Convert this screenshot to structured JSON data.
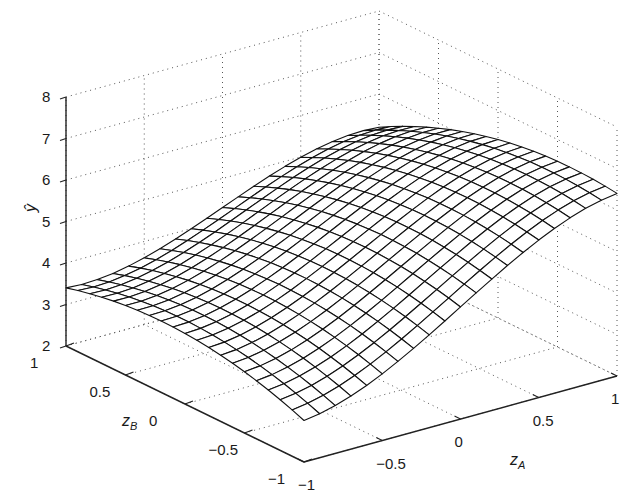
{
  "chart_data": {
    "type": "surface",
    "title": "",
    "xlabel": "z_A",
    "ylabel": "z_B",
    "zlabel": "ŷ",
    "x_axis": {
      "label_main": "z",
      "label_sub": "A",
      "range": [
        -1,
        1
      ],
      "ticks": [
        -1,
        -0.5,
        0,
        0.5,
        1
      ],
      "tick_labels": [
        "−1",
        "−0.5",
        "0",
        "0.5",
        "1"
      ]
    },
    "y_axis": {
      "label_main": "z",
      "label_sub": "B",
      "range": [
        -1,
        1
      ],
      "ticks": [
        -1,
        -0.5,
        0,
        0.5,
        1
      ],
      "tick_labels": [
        "−1",
        "−0.5",
        "0",
        "0.5",
        "1"
      ]
    },
    "z_axis": {
      "label": "ŷ",
      "range": [
        2,
        8
      ],
      "ticks": [
        2,
        3,
        4,
        5,
        6,
        7,
        8
      ],
      "tick_labels": [
        "2",
        "3",
        "4",
        "5",
        "6",
        "7",
        "8"
      ]
    },
    "grid": true,
    "mesh_resolution": 21,
    "surface_model": {
      "description": "approximate fitted response surface y = c0 + c1*(1.5zA - 0.5zA^3) + c2*zB + c3*zB^2 + c4*zA*zB",
      "c0": 5.0,
      "c1": 1.3,
      "c2": -0.2,
      "c3": -0.5,
      "c4": -0.4
    },
    "sample_values": {
      "zA": [
        -1,
        -0.5,
        0,
        0.5,
        1
      ],
      "zB": [
        -1,
        -0.5,
        0,
        0.5,
        1
      ],
      "y_rows_by_zB": [
        [
          3.0,
          3.5,
          4.7,
          5.8,
          6.4
        ],
        [
          3.3,
          3.8,
          4.9,
          5.9,
          6.4
        ],
        [
          3.7,
          4.0,
          5.0,
          6.0,
          6.3
        ],
        [
          3.6,
          3.9,
          4.8,
          5.7,
          5.9
        ],
        [
          3.4,
          3.7,
          4.3,
          5.2,
          5.0
        ]
      ]
    }
  }
}
